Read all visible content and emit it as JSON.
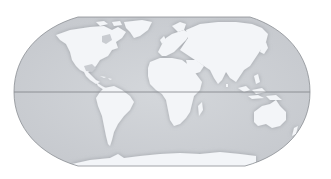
{
  "map": {
    "type": "world-map",
    "projection": "robinson",
    "style": "grayscale",
    "colors": {
      "background": "#ffffff",
      "ocean": "#cfd2d6",
      "ocean_shade": "#b9bdc2",
      "land": "#f3f5f8",
      "outline": "#8a8e93",
      "equator": "#7d8186"
    },
    "features": {
      "equator_line": true,
      "graticule": false,
      "labels": false
    },
    "continents": [
      {
        "name": "North America"
      },
      {
        "name": "Greenland"
      },
      {
        "name": "South America"
      },
      {
        "name": "Europe"
      },
      {
        "name": "Africa"
      },
      {
        "name": "Asia"
      },
      {
        "name": "Australia"
      },
      {
        "name": "Antarctica"
      }
    ]
  }
}
